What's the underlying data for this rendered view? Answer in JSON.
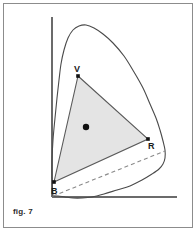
{
  "figure": {
    "caption": "fig. 7",
    "type": "chromaticity-diagram"
  },
  "colors": {
    "frame": "#8c8c8c",
    "axis": "#6b6b6b",
    "curve": "#4a4a4a",
    "triangle_stroke": "#5a5a5a",
    "triangle_fill": "#e4e4e4",
    "dashed_line": "#8a8a8a",
    "vertex_dot": "#111111",
    "label_text": "#1a1a1a"
  },
  "labels": {
    "vertex_v": "V",
    "vertex_r": "R",
    "vertex_b": "B"
  },
  "chart_data": {
    "type": "scatter",
    "title": "fig. 7",
    "xlabel": "",
    "ylabel": "",
    "grid": false,
    "legend": null,
    "axes": {
      "x_axis": {
        "from": [
          52,
          197
        ],
        "to": [
          177,
          197
        ]
      },
      "y_axis": {
        "from": [
          52,
          197
        ],
        "to": [
          52,
          17
        ]
      }
    },
    "spectral_locus": {
      "name": "spectral locus",
      "closed": false,
      "points": [
        [
          53,
          196
        ],
        [
          52,
          178
        ],
        [
          52,
          160
        ],
        [
          53,
          140
        ],
        [
          55,
          118
        ],
        [
          57,
          98
        ],
        [
          59,
          80
        ],
        [
          61,
          64
        ],
        [
          64,
          50
        ],
        [
          68,
          38
        ],
        [
          73,
          30
        ],
        [
          79,
          26
        ],
        [
          86,
          25
        ],
        [
          94,
          28
        ],
        [
          103,
          34
        ],
        [
          113,
          43
        ],
        [
          124,
          56
        ],
        [
          134,
          72
        ],
        [
          143,
          88
        ],
        [
          150,
          104
        ],
        [
          156,
          118
        ],
        [
          160,
          130
        ],
        [
          163,
          141
        ],
        [
          165,
          150
        ],
        [
          165,
          158
        ],
        [
          163,
          164
        ],
        [
          159,
          169
        ],
        [
          152,
          174
        ],
        [
          142,
          180
        ],
        [
          130,
          186
        ],
        [
          117,
          190
        ],
        [
          104,
          194
        ],
        [
          92,
          197
        ],
        [
          82,
          198
        ],
        [
          73,
          198
        ],
        [
          65,
          197
        ],
        [
          58,
          196
        ],
        [
          53,
          196
        ]
      ]
    },
    "purple_line": {
      "name": "line of purples",
      "style": "dashed",
      "from": [
        53,
        196
      ],
      "to": [
        165,
        151
      ]
    },
    "gamut_triangle": {
      "name": "display gamut",
      "fill": "#e4e4e4",
      "vertices": [
        {
          "id": "V",
          "label": "V",
          "x": 78,
          "y": 76
        },
        {
          "id": "R",
          "label": "R",
          "x": 148,
          "y": 139
        },
        {
          "id": "B",
          "label": "B",
          "x": 54,
          "y": 182
        }
      ]
    },
    "white_point": {
      "label": "",
      "x": 86,
      "y": 127,
      "radius": 3.2
    }
  }
}
